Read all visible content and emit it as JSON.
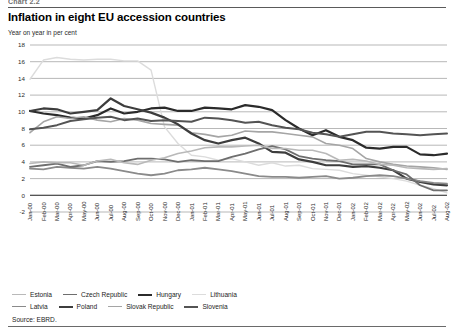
{
  "header": {
    "chart_number": "Chart 2.2",
    "title": "Inflation in eight EU accession countries",
    "subtitle": "Year on year in per cent"
  },
  "footer": {
    "source": "Source: EBRD."
  },
  "legend": {
    "row1": [
      {
        "label": "Estonia",
        "color": "#b9b9b9",
        "width": 1.6
      },
      {
        "label": "Czech Republic",
        "color": "#6e6e6e",
        "width": 1.8
      },
      {
        "label": "Hungary",
        "color": "#2b2b2b",
        "width": 2.2
      },
      {
        "label": "Lithuania",
        "color": "#dcdcdc",
        "width": 1.4
      }
    ],
    "row2": [
      {
        "label": "Latvia",
        "color": "#8a8a8a",
        "width": 1.8
      },
      {
        "label": "Poland",
        "color": "#3d3d3d",
        "width": 2.2
      },
      {
        "label": "Slovak Republic",
        "color": "#a5a5a5",
        "width": 1.6
      },
      {
        "label": "Slovenia",
        "color": "#545454",
        "width": 2.0
      }
    ]
  },
  "chart_data": {
    "type": "line",
    "title": "Inflation in eight EU accession countries",
    "subtitle": "Year on year in per cent",
    "xlabel": "",
    "ylabel": "Year on year in per cent",
    "ylim": [
      -2,
      18
    ],
    "ytick_step": 2,
    "yticks": [
      18,
      16,
      14,
      12,
      10,
      8,
      6,
      4,
      2,
      0,
      -2
    ],
    "grid": true,
    "grid_axis": "y",
    "legend_position": "bottom",
    "source": "Source: EBRD.",
    "x": [
      "Jan-00",
      "Feb-00",
      "Mar-00",
      "Apr-00",
      "May-00",
      "Jun-00",
      "Jul-00",
      "Aug-00",
      "Sep-00",
      "Oct-00",
      "Nov-00",
      "Dec-00",
      "Jan-01",
      "Feb-01",
      "Mar-01",
      "Apr-01",
      "May-01",
      "Jun-01",
      "Jul-01",
      "Aug-01",
      "Sep-01",
      "Oct-01",
      "Nov-01",
      "Dec-01",
      "Jan-02",
      "Feb-02",
      "Mar-02",
      "Apr-02",
      "May-02",
      "Jun-02",
      "Jul-02",
      "Aug-02"
    ],
    "series": [
      {
        "name": "Lithuania",
        "color": "#dcdcdc",
        "width": 1.4,
        "values": [
          13.9,
          16.2,
          16.5,
          16.3,
          16.2,
          16.3,
          16.3,
          16.1,
          16.1,
          15.0,
          8.2,
          6.2,
          4.8,
          4.6,
          4.2,
          4.4,
          4.0,
          3.6,
          3.9,
          3.5,
          3.6,
          3.2,
          3.1,
          3.0,
          2.6,
          2.4,
          2.2,
          2.0,
          1.7,
          1.2,
          0.8,
          0.3
        ]
      },
      {
        "name": "Hungary",
        "color": "#2b2b2b",
        "width": 2.2,
        "values": [
          10.1,
          9.8,
          9.6,
          9.3,
          9.2,
          9.6,
          10.4,
          9.8,
          10.0,
          10.4,
          10.5,
          10.1,
          10.1,
          10.5,
          10.4,
          10.3,
          10.8,
          10.6,
          10.2,
          9.0,
          8.0,
          7.2,
          7.8,
          7.0,
          6.6,
          5.7,
          5.6,
          5.8,
          5.8,
          4.9,
          4.8,
          5.0
        ]
      },
      {
        "name": "Slovak Republic",
        "color": "#a5a5a5",
        "width": 1.6,
        "values": [
          7.5,
          8.8,
          9.4,
          9.2,
          9.4,
          9.0,
          8.8,
          9.2,
          9.0,
          8.6,
          8.5,
          8.4,
          7.5,
          7.3,
          7.0,
          7.2,
          7.7,
          7.6,
          7.6,
          7.4,
          7.2,
          7.0,
          6.2,
          6.0,
          5.6,
          4.4,
          4.0,
          3.7,
          3.5,
          3.4,
          3.3,
          3.1
        ]
      },
      {
        "name": "Poland",
        "color": "#3d3d3d",
        "width": 2.2,
        "values": [
          10.1,
          10.4,
          10.3,
          9.8,
          10.0,
          10.2,
          11.6,
          10.7,
          10.3,
          9.9,
          9.3,
          8.5,
          7.4,
          6.6,
          6.2,
          6.6,
          6.9,
          6.2,
          5.2,
          5.1,
          4.3,
          4.0,
          3.6,
          3.6,
          3.4,
          3.5,
          3.3,
          3.0,
          2.0,
          1.6,
          1.3,
          1.2
        ]
      },
      {
        "name": "Slovenia",
        "color": "#545454",
        "width": 2.0,
        "values": [
          7.9,
          8.1,
          8.4,
          8.9,
          9.1,
          9.3,
          9.4,
          9.0,
          9.2,
          8.9,
          9.0,
          8.9,
          8.8,
          9.3,
          9.2,
          9.0,
          8.7,
          8.8,
          8.4,
          8.1,
          7.9,
          7.5,
          7.3,
          7.0,
          7.3,
          7.6,
          7.6,
          7.4,
          7.3,
          7.2,
          7.3,
          7.4
        ]
      },
      {
        "name": "Latvia",
        "color": "#8a8a8a",
        "width": 1.8,
        "values": [
          3.2,
          3.1,
          3.4,
          3.3,
          3.2,
          3.4,
          3.2,
          2.9,
          2.6,
          2.4,
          2.6,
          3.0,
          3.1,
          3.3,
          3.1,
          2.9,
          2.6,
          2.3,
          2.2,
          2.2,
          2.1,
          2.2,
          2.3,
          2.0,
          2.1,
          2.3,
          2.4,
          2.3,
          2.0,
          1.7,
          1.5,
          1.4
        ]
      },
      {
        "name": "Czech Republic",
        "color": "#6e6e6e",
        "width": 1.8,
        "values": [
          3.4,
          3.6,
          3.8,
          3.4,
          3.6,
          4.1,
          4.0,
          4.1,
          4.4,
          4.4,
          4.3,
          4.0,
          4.2,
          4.1,
          4.1,
          4.6,
          5.0,
          5.5,
          5.9,
          5.5,
          4.7,
          4.4,
          4.2,
          4.1,
          3.7,
          3.7,
          3.7,
          3.0,
          2.5,
          1.2,
          0.6,
          0.6
        ]
      },
      {
        "name": "Estonia",
        "color": "#b9b9b9",
        "width": 1.6,
        "values": [
          3.8,
          4.0,
          3.9,
          3.9,
          3.6,
          4.1,
          4.3,
          3.9,
          3.7,
          4.2,
          4.5,
          5.0,
          5.3,
          5.7,
          5.8,
          5.8,
          5.9,
          6.0,
          5.6,
          5.6,
          5.4,
          5.4,
          5.0,
          4.2,
          4.3,
          4.1,
          3.7,
          3.6,
          3.3,
          3.2,
          3.1,
          3.2
        ]
      }
    ]
  }
}
